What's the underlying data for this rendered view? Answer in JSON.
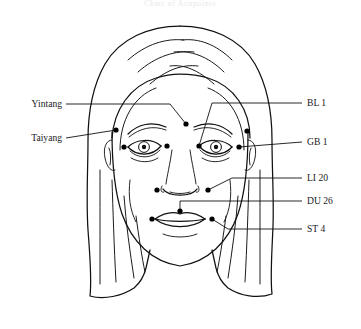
{
  "figure": {
    "title": "Chart of Acupoints",
    "title_visible": false,
    "background_color": "#ffffff",
    "ink_color": "#111111",
    "width": 361,
    "height": 329
  },
  "labels_left": [
    {
      "id": "yintang",
      "text": "Yintang",
      "x": 62,
      "y": 107,
      "leader_to_x": 186,
      "leader_to_y": 124
    },
    {
      "id": "taiyang",
      "text": "Taiyang",
      "x": 62,
      "y": 141,
      "leader_to_x": 116,
      "leader_to_y": 130
    }
  ],
  "labels_right": [
    {
      "id": "bl1",
      "text": "BL 1",
      "x": 307,
      "y": 106,
      "leader_to_x": 247,
      "leader_to_y": 117
    },
    {
      "id": "gb1",
      "text": "GB 1",
      "x": 307,
      "y": 145,
      "leader_to_x": 246,
      "leader_to_y": 145
    },
    {
      "id": "li20",
      "text": "LI 20",
      "x": 307,
      "y": 181,
      "leader_to_x": 208,
      "leader_to_y": 190
    },
    {
      "id": "du26",
      "text": "DU 26",
      "x": 307,
      "y": 204,
      "leader_to_x": 180,
      "leader_to_y": 211
    },
    {
      "id": "st4",
      "text": "ST 4",
      "x": 307,
      "y": 232,
      "leader_to_x": 212,
      "leader_to_y": 219
    }
  ],
  "acupoints": [
    {
      "id": "yintang-point",
      "label": "Yintang",
      "x": 186,
      "y": 124
    },
    {
      "id": "taiyang-left",
      "label": "Taiyang",
      "x": 116,
      "y": 130
    },
    {
      "id": "taiyang-right",
      "label": "Taiyang",
      "x": 247,
      "y": 131
    },
    {
      "id": "bl1-left",
      "label": "BL 1",
      "x": 167,
      "y": 146
    },
    {
      "id": "bl1-right",
      "label": "BL 1",
      "x": 199,
      "y": 146
    },
    {
      "id": "gb1-left",
      "label": "GB 1",
      "x": 124,
      "y": 147
    },
    {
      "id": "gb1-right",
      "label": "GB 1",
      "x": 239,
      "y": 147
    },
    {
      "id": "li20-left",
      "label": "LI 20",
      "x": 157,
      "y": 190
    },
    {
      "id": "li20-right",
      "label": "LI 20",
      "x": 208,
      "y": 190
    },
    {
      "id": "du26-point",
      "label": "DU 26",
      "x": 180,
      "y": 211
    },
    {
      "id": "st4-left",
      "label": "ST 4",
      "x": 152,
      "y": 219
    },
    {
      "id": "st4-right",
      "label": "ST 4",
      "x": 212,
      "y": 219
    }
  ],
  "colors": {
    "ink": "#111111",
    "background": "#ffffff",
    "title_faint": "#e8e8ea"
  }
}
